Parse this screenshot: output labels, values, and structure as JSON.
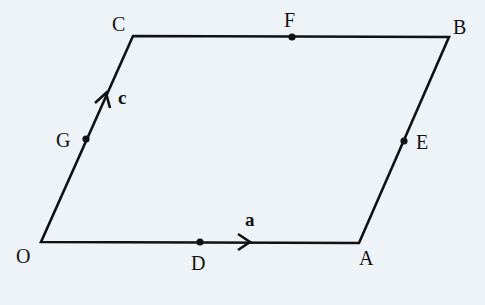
{
  "diagram": {
    "type": "parallelogram",
    "colors": {
      "background": "#eef3f8",
      "line": "#111111"
    },
    "vertices": [
      {
        "id": "O",
        "label": "O",
        "x": 41,
        "y": 242
      },
      {
        "id": "A",
        "label": "A",
        "x": 359,
        "y": 243
      },
      {
        "id": "B",
        "label": "B",
        "x": 449,
        "y": 37
      },
      {
        "id": "C",
        "label": "C",
        "x": 133,
        "y": 36
      }
    ],
    "points": [
      {
        "id": "D",
        "label": "D",
        "x": 200,
        "y": 242,
        "on": "OA"
      },
      {
        "id": "E",
        "label": "E",
        "x": 404,
        "y": 141,
        "on": "AB"
      },
      {
        "id": "F",
        "label": "F",
        "x": 292,
        "y": 37,
        "on": "CB"
      },
      {
        "id": "G",
        "label": "G",
        "x": 86,
        "y": 139,
        "on": "OC"
      }
    ],
    "vectors": [
      {
        "id": "a",
        "label": "a",
        "along": "OA"
      },
      {
        "id": "c",
        "label": "c",
        "along": "OC"
      }
    ]
  }
}
